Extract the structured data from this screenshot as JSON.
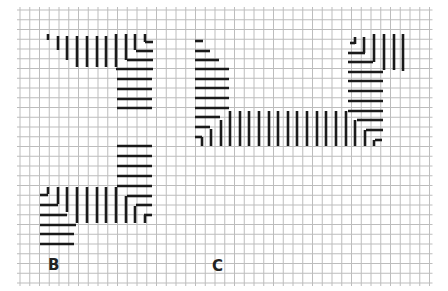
{
  "figure": {
    "labels": [
      {
        "text": "B",
        "x": 48,
        "y": 256
      },
      {
        "text": "C",
        "x": 212,
        "y": 257
      }
    ]
  },
  "grid": {
    "x0": 20,
    "y0": 10,
    "cols": 42,
    "rows": 28,
    "cell": 9.75,
    "color": "#bdbdbd"
  },
  "stitch_color": "#1a1a1a",
  "stitches": {
    "B": [
      {
        "o": "v",
        "x": 48,
        "y1": 34,
        "y2": 40
      },
      {
        "o": "v",
        "x": 58,
        "y1": 36,
        "y2": 50
      },
      {
        "o": "v",
        "x": 67,
        "y1": 36,
        "y2": 60
      },
      {
        "o": "v",
        "x": 77,
        "y1": 36,
        "y2": 67
      },
      {
        "o": "v",
        "x": 87,
        "y1": 36,
        "y2": 67
      },
      {
        "o": "v",
        "x": 97,
        "y1": 36,
        "y2": 67
      },
      {
        "o": "v",
        "x": 106,
        "y1": 36,
        "y2": 67
      },
      {
        "o": "v",
        "x": 116,
        "y1": 34,
        "y2": 67
      },
      {
        "o": "v",
        "x": 126,
        "y1": 34,
        "y2": 60
      },
      {
        "o": "v",
        "x": 135,
        "y1": 34,
        "y2": 50
      },
      {
        "o": "v",
        "x": 145,
        "y1": 34,
        "y2": 42
      },
      {
        "o": "h",
        "y": 42,
        "x1": 145,
        "x2": 153
      },
      {
        "o": "h",
        "y": 51,
        "x1": 136,
        "x2": 153
      },
      {
        "o": "h",
        "y": 60,
        "x1": 127,
        "x2": 153
      },
      {
        "o": "h",
        "y": 69,
        "x1": 116,
        "x2": 153
      },
      {
        "o": "h",
        "y": 79,
        "x1": 117,
        "x2": 152
      },
      {
        "o": "h",
        "y": 89,
        "x1": 117,
        "x2": 152
      },
      {
        "o": "h",
        "y": 99,
        "x1": 117,
        "x2": 152
      },
      {
        "o": "h",
        "y": 108,
        "x1": 117,
        "x2": 152
      },
      {
        "o": "h",
        "y": 146,
        "x1": 117,
        "x2": 152
      },
      {
        "o": "h",
        "y": 156,
        "x1": 117,
        "x2": 152
      },
      {
        "o": "h",
        "y": 166,
        "x1": 117,
        "x2": 152
      },
      {
        "o": "h",
        "y": 176,
        "x1": 117,
        "x2": 152
      },
      {
        "o": "h",
        "y": 186,
        "x1": 117,
        "x2": 152
      },
      {
        "o": "h",
        "y": 196,
        "x1": 127,
        "x2": 152
      },
      {
        "o": "h",
        "y": 205,
        "x1": 136,
        "x2": 152
      },
      {
        "o": "h",
        "y": 215,
        "x1": 144,
        "x2": 152
      },
      {
        "o": "v",
        "x": 48,
        "y1": 187,
        "y2": 194
      },
      {
        "o": "v",
        "x": 58,
        "y1": 187,
        "y2": 204
      },
      {
        "o": "v",
        "x": 67,
        "y1": 187,
        "y2": 212
      },
      {
        "o": "v",
        "x": 77,
        "y1": 187,
        "y2": 223
      },
      {
        "o": "v",
        "x": 87,
        "y1": 187,
        "y2": 223
      },
      {
        "o": "v",
        "x": 97,
        "y1": 187,
        "y2": 223
      },
      {
        "o": "v",
        "x": 106,
        "y1": 187,
        "y2": 223
      },
      {
        "o": "v",
        "x": 116,
        "y1": 187,
        "y2": 223
      },
      {
        "o": "v",
        "x": 126,
        "y1": 196,
        "y2": 223
      },
      {
        "o": "v",
        "x": 135,
        "y1": 206,
        "y2": 223
      },
      {
        "o": "v",
        "x": 145,
        "y1": 215,
        "y2": 223
      },
      {
        "o": "h",
        "y": 195,
        "x1": 40,
        "x2": 48
      },
      {
        "o": "h",
        "y": 205,
        "x1": 40,
        "x2": 58
      },
      {
        "o": "h",
        "y": 215,
        "x1": 40,
        "x2": 67
      },
      {
        "o": "h",
        "y": 225,
        "x1": 40,
        "x2": 76
      },
      {
        "o": "h",
        "y": 234,
        "x1": 40,
        "x2": 74
      },
      {
        "o": "h",
        "y": 244,
        "x1": 40,
        "x2": 74
      }
    ],
    "C": [
      {
        "o": "h",
        "y": 41,
        "x1": 195,
        "x2": 203
      },
      {
        "o": "h",
        "y": 51,
        "x1": 195,
        "x2": 210
      },
      {
        "o": "h",
        "y": 60,
        "x1": 195,
        "x2": 219
      },
      {
        "o": "h",
        "y": 69,
        "x1": 195,
        "x2": 229
      },
      {
        "o": "h",
        "y": 79,
        "x1": 195,
        "x2": 229
      },
      {
        "o": "h",
        "y": 88,
        "x1": 195,
        "x2": 229
      },
      {
        "o": "h",
        "y": 98,
        "x1": 195,
        "x2": 229
      },
      {
        "o": "h",
        "y": 108,
        "x1": 195,
        "x2": 229
      },
      {
        "o": "h",
        "y": 117,
        "x1": 195,
        "x2": 220
      },
      {
        "o": "h",
        "y": 127,
        "x1": 195,
        "x2": 210
      },
      {
        "o": "h",
        "y": 137,
        "x1": 195,
        "x2": 202
      },
      {
        "o": "v",
        "x": 202,
        "y1": 137,
        "y2": 146
      },
      {
        "o": "v",
        "x": 211,
        "y1": 129,
        "y2": 146
      },
      {
        "o": "v",
        "x": 221,
        "y1": 120,
        "y2": 146
      },
      {
        "o": "v",
        "x": 230,
        "y1": 111,
        "y2": 146
      },
      {
        "o": "v",
        "x": 240,
        "y1": 111,
        "y2": 146
      },
      {
        "o": "v",
        "x": 249,
        "y1": 111,
        "y2": 146
      },
      {
        "o": "v",
        "x": 259,
        "y1": 111,
        "y2": 146
      },
      {
        "o": "v",
        "x": 269,
        "y1": 111,
        "y2": 146
      },
      {
        "o": "v",
        "x": 278,
        "y1": 111,
        "y2": 146
      },
      {
        "o": "v",
        "x": 288,
        "y1": 111,
        "y2": 146
      },
      {
        "o": "v",
        "x": 297,
        "y1": 111,
        "y2": 146
      },
      {
        "o": "v",
        "x": 307,
        "y1": 111,
        "y2": 146
      },
      {
        "o": "v",
        "x": 317,
        "y1": 111,
        "y2": 146
      },
      {
        "o": "v",
        "x": 326,
        "y1": 111,
        "y2": 146
      },
      {
        "o": "v",
        "x": 336,
        "y1": 111,
        "y2": 146
      },
      {
        "o": "v",
        "x": 346,
        "y1": 111,
        "y2": 146
      },
      {
        "o": "v",
        "x": 355,
        "y1": 120,
        "y2": 146
      },
      {
        "o": "v",
        "x": 365,
        "y1": 130,
        "y2": 146
      },
      {
        "o": "v",
        "x": 374,
        "y1": 140,
        "y2": 146
      },
      {
        "o": "h",
        "y": 120,
        "x1": 357,
        "x2": 383
      },
      {
        "o": "h",
        "y": 130,
        "x1": 366,
        "x2": 383
      },
      {
        "o": "h",
        "y": 140,
        "x1": 375,
        "x2": 382
      },
      {
        "o": "h",
        "y": 111,
        "x1": 348,
        "x2": 383
      },
      {
        "o": "h",
        "y": 101,
        "x1": 348,
        "x2": 383
      },
      {
        "o": "h",
        "y": 91,
        "x1": 348,
        "x2": 383
      },
      {
        "o": "h",
        "y": 81,
        "x1": 348,
        "x2": 383
      },
      {
        "o": "h",
        "y": 72,
        "x1": 348,
        "x2": 383
      },
      {
        "o": "h",
        "y": 62,
        "x1": 348,
        "x2": 373
      },
      {
        "o": "h",
        "y": 53,
        "x1": 348,
        "x2": 365
      },
      {
        "o": "h",
        "y": 43,
        "x1": 350,
        "x2": 355
      },
      {
        "o": "v",
        "x": 355,
        "y1": 37,
        "y2": 44
      },
      {
        "o": "v",
        "x": 364,
        "y1": 37,
        "y2": 53
      },
      {
        "o": "v",
        "x": 374,
        "y1": 34,
        "y2": 62
      },
      {
        "o": "v",
        "x": 384,
        "y1": 34,
        "y2": 70
      },
      {
        "o": "v",
        "x": 394,
        "y1": 34,
        "y2": 70
      },
      {
        "o": "v",
        "x": 403,
        "y1": 34,
        "y2": 71
      }
    ]
  }
}
